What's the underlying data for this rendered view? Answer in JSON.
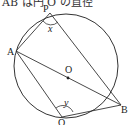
{
  "caption": "AB は円 O の直径",
  "diagram": {
    "center_label": "O",
    "points": {
      "A": "A",
      "B": "B",
      "P": "P",
      "Q": "Q"
    },
    "angles": {
      "at_P": "x",
      "at_Q": "y"
    },
    "colors": {
      "stroke": "#333333"
    }
  }
}
